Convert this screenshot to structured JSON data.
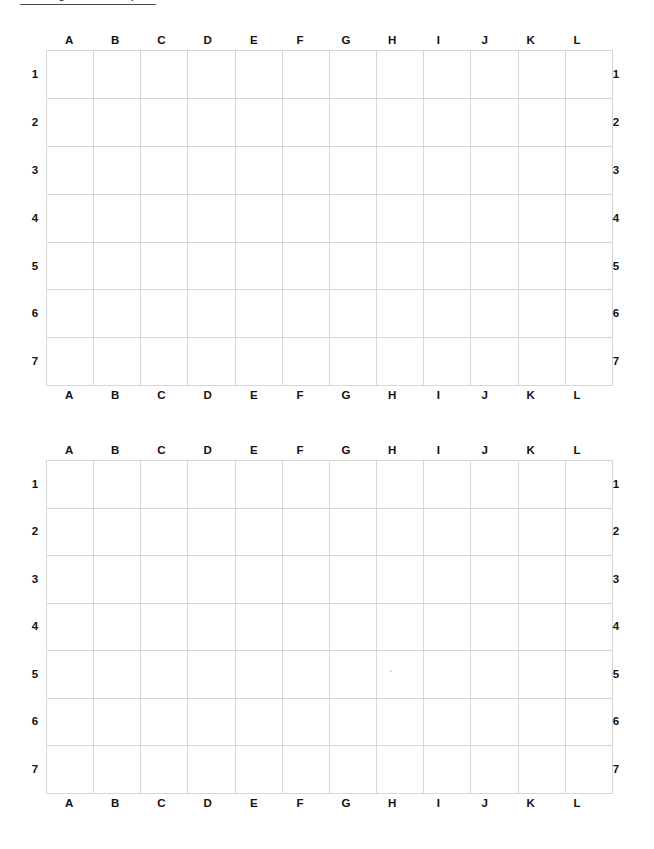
{
  "page": {
    "title_text": "Seating Chart Template",
    "title_underlined": true,
    "background_color": "#ffffff",
    "grid_line_color": "#d6d6d6",
    "label_color": "#111111"
  },
  "grids": [
    {
      "name": "grid-top",
      "columns": [
        "A",
        "B",
        "C",
        "D",
        "E",
        "F",
        "G",
        "H",
        "I",
        "J",
        "K",
        "L"
      ],
      "rows": [
        "1",
        "2",
        "3",
        "4",
        "5",
        "6",
        "7"
      ],
      "cells": [
        [
          "",
          "",
          "",
          "",
          "",
          "",
          "",
          "",
          "",
          "",
          "",
          ""
        ],
        [
          "",
          "",
          "",
          "",
          "",
          "",
          "",
          "",
          "",
          "",
          "",
          ""
        ],
        [
          "",
          "",
          "",
          "",
          "",
          "",
          "",
          "",
          "",
          "",
          "",
          ""
        ],
        [
          "",
          "",
          "",
          "",
          "",
          "",
          "",
          "",
          "",
          "",
          "",
          ""
        ],
        [
          "",
          "",
          "",
          "",
          "",
          "",
          "",
          "",
          "",
          "",
          "",
          ""
        ],
        [
          "",
          "",
          "",
          "",
          "",
          "",
          "",
          "",
          "",
          "",
          "",
          ""
        ],
        [
          "",
          "",
          "",
          "",
          "",
          "",
          "",
          "",
          "",
          "",
          "",
          ""
        ]
      ]
    },
    {
      "name": "grid-bottom",
      "columns": [
        "A",
        "B",
        "C",
        "D",
        "E",
        "F",
        "G",
        "H",
        "I",
        "J",
        "K",
        "L"
      ],
      "rows": [
        "1",
        "2",
        "3",
        "4",
        "5",
        "6",
        "7"
      ],
      "cells": [
        [
          "",
          "",
          "",
          "",
          "",
          "",
          "",
          "",
          "",
          "",
          "",
          ""
        ],
        [
          "",
          "",
          "",
          "",
          "",
          "",
          "",
          "",
          "",
          "",
          "",
          ""
        ],
        [
          "",
          "",
          "",
          "",
          "",
          "",
          "",
          "",
          "",
          "",
          "",
          ""
        ],
        [
          "",
          "",
          "",
          "",
          "",
          "",
          "",
          "",
          "",
          "",
          "",
          ""
        ],
        [
          "",
          "",
          "",
          "",
          "",
          "",
          "",
          "",
          "",
          "",
          "",
          ""
        ],
        [
          "",
          "",
          "",
          "",
          "",
          "",
          "",
          "",
          "",
          "",
          "",
          ""
        ],
        [
          "",
          "",
          "",
          "",
          "",
          "",
          "",
          "",
          "",
          "",
          "",
          ""
        ]
      ]
    }
  ]
}
